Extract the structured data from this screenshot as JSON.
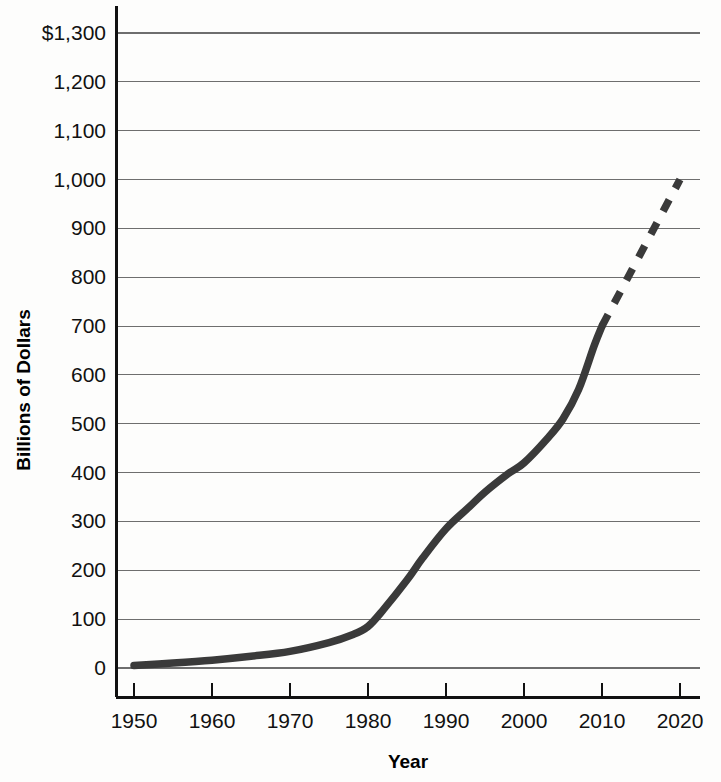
{
  "chart_data": {
    "type": "line",
    "title": "",
    "xlabel": "Year",
    "ylabel": "Billions of Dollars",
    "xlim": [
      1950,
      2020
    ],
    "ylim": [
      0,
      1300
    ],
    "grid": true,
    "legend": "none",
    "x_ticks": [
      1950,
      1960,
      1970,
      1980,
      1990,
      2000,
      2010,
      2020
    ],
    "x_tick_labels": [
      "1950",
      "1960",
      "1970",
      "1980",
      "1990",
      "2000",
      "2010",
      "2020"
    ],
    "y_ticks": [
      0,
      100,
      200,
      300,
      400,
      500,
      600,
      700,
      800,
      900,
      1000,
      1100,
      1200,
      1300
    ],
    "y_tick_labels": [
      "0",
      "100",
      "200",
      "300",
      "400",
      "500",
      "600",
      "700",
      "800",
      "900",
      "1,000",
      "1,100",
      "1,200",
      "$1,300"
    ],
    "series": [
      {
        "name": "Actual",
        "style": "solid",
        "color": "#3a3a3a",
        "x": [
          1950,
          1955,
          1960,
          1965,
          1970,
          1975,
          1978,
          1980,
          1982,
          1985,
          1987,
          1990,
          1993,
          1995,
          1998,
          2000,
          2003,
          2005,
          2007,
          2009,
          2010
        ],
        "values": [
          5,
          10,
          16,
          24,
          34,
          52,
          68,
          85,
          120,
          180,
          225,
          285,
          330,
          360,
          398,
          420,
          470,
          510,
          570,
          660,
          700
        ]
      },
      {
        "name": "Projected",
        "style": "dashed",
        "color": "#3a3a3a",
        "x": [
          2010,
          2020
        ],
        "values": [
          700,
          1000
        ]
      }
    ]
  }
}
